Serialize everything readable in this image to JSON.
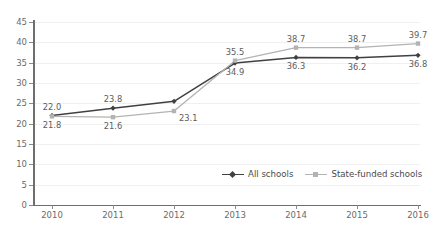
{
  "chart_data": {
    "type": "line",
    "title": "",
    "subtitle": "",
    "xlabel": "",
    "ylabel": "",
    "categories": [
      "2010",
      "2011",
      "2012",
      "2013",
      "2014",
      "2015",
      "2016"
    ],
    "ylim": [
      0,
      45
    ],
    "ytick_step": 5,
    "yticks": [
      "0",
      "5",
      "10",
      "15",
      "20",
      "25",
      "30",
      "35",
      "40",
      "45"
    ],
    "grid": "horizontal",
    "legend_position": "bottom-right",
    "series": [
      {
        "name": "All schools",
        "color": "#404040",
        "marker": "diamond",
        "values": [
          22.0,
          23.8,
          25.5,
          34.9,
          36.3,
          36.2,
          36.8
        ],
        "labels": [
          "22.0",
          "23.8",
          "",
          "34.9",
          "36.3",
          "36.2",
          "36.8"
        ],
        "label_positions": [
          "above",
          "above",
          "none",
          "below",
          "below",
          "below",
          "below"
        ]
      },
      {
        "name": "State-funded schools",
        "color": "#b3b3b3",
        "marker": "square",
        "values": [
          21.8,
          21.6,
          23.1,
          35.5,
          38.7,
          38.7,
          39.7
        ],
        "labels": [
          "21.8",
          "21.6",
          "23.1",
          "35.5",
          "38.7",
          "38.7",
          "39.7"
        ],
        "label_positions": [
          "below",
          "below",
          "right",
          "above",
          "above",
          "above",
          "above"
        ]
      }
    ]
  },
  "legend": {
    "items": [
      {
        "label": "All schools",
        "color": "#404040"
      },
      {
        "label": "State-funded schools",
        "color": "#b3b3b3"
      }
    ]
  }
}
